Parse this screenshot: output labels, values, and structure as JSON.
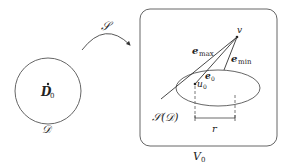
{
  "diagram": {
    "type": "mapping-diagram",
    "colors": {
      "stroke": "#555555",
      "text": "#222222",
      "background": "#ffffff"
    },
    "source": {
      "shape": "circle",
      "center_label": "D",
      "center_label_sub": "0",
      "set_label": "𝒟"
    },
    "mapping": {
      "label": "𝒮",
      "shape": "curved-arrow"
    },
    "target": {
      "shape": "rounded-rectangle",
      "box_label": "V",
      "box_label_sub": "0",
      "ellipse_label": "𝒮(𝒟)",
      "point_v": "v",
      "point_u": "u",
      "point_u_sub": "0",
      "vectors": [
        {
          "name": "e",
          "sub": "max"
        },
        {
          "name": "e",
          "sub": "0"
        },
        {
          "name": "e",
          "sub": "min"
        }
      ],
      "radius_label": "r"
    }
  }
}
